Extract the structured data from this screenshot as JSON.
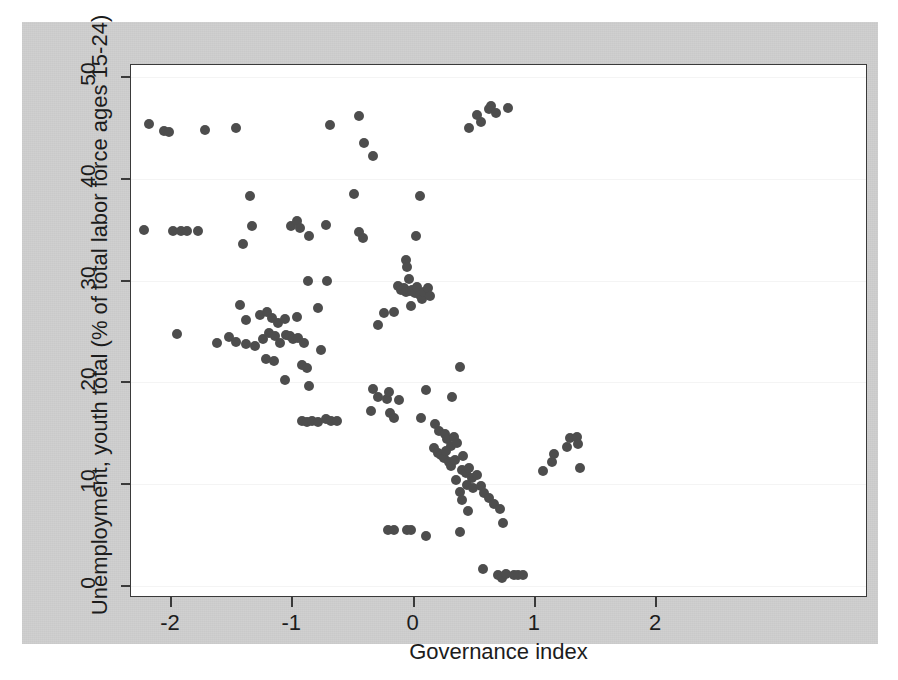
{
  "figure": {
    "background_color": "#cfcfcf",
    "panel_color": "#ffffff",
    "marker_color": "#4d4d4d",
    "axis_color": "#3a3a3a"
  },
  "chart_data": {
    "type": "scatter",
    "title": "",
    "xlabel": "Governance index",
    "ylabel": "Unemployment, youth total (% of total labor force ages 15-24)",
    "xlim": [
      -2.32,
      2.08
    ],
    "ylim": [
      -1.2,
      51.5
    ],
    "xticks": [
      -2,
      -1,
      0,
      1,
      2
    ],
    "xtick_labels": [
      "-2",
      "-1",
      "0",
      "1",
      "2"
    ],
    "yticks": [
      0,
      10,
      20,
      30,
      40,
      50
    ],
    "ytick_labels": [
      "0",
      "10",
      "20",
      "30",
      "40",
      "50"
    ],
    "grid": "horizontal-faint",
    "legend": "none",
    "series_name": "countries",
    "marker": "filled-circle",
    "points": [
      [
        -2.18,
        45.4
      ],
      [
        -2.06,
        44.7
      ],
      [
        -2.02,
        44.6
      ],
      [
        -1.72,
        44.8
      ],
      [
        -1.46,
        45.0
      ],
      [
        -0.69,
        45.3
      ],
      [
        -0.45,
        46.2
      ],
      [
        -0.41,
        43.5
      ],
      [
        -0.33,
        42.2
      ],
      [
        0.46,
        45.0
      ],
      [
        0.52,
        46.3
      ],
      [
        0.56,
        45.6
      ],
      [
        0.62,
        46.9
      ],
      [
        0.64,
        47.2
      ],
      [
        0.68,
        46.5
      ],
      [
        0.78,
        47.0
      ],
      [
        -1.35,
        38.3
      ],
      [
        -0.49,
        38.5
      ],
      [
        0.05,
        38.3
      ],
      [
        -2.22,
        35.0
      ],
      [
        -1.98,
        34.9
      ],
      [
        -1.92,
        34.9
      ],
      [
        -1.87,
        34.9
      ],
      [
        -1.78,
        34.9
      ],
      [
        -1.41,
        33.6
      ],
      [
        -1.33,
        35.4
      ],
      [
        -1.01,
        35.4
      ],
      [
        -0.96,
        35.9
      ],
      [
        -0.94,
        35.2
      ],
      [
        -0.86,
        34.4
      ],
      [
        -0.72,
        35.5
      ],
      [
        -0.45,
        34.8
      ],
      [
        -0.42,
        34.2
      ],
      [
        0.02,
        34.4
      ],
      [
        -0.06,
        32.0
      ],
      [
        -0.05,
        31.3
      ],
      [
        -0.87,
        30.0
      ],
      [
        -0.71,
        30.0
      ],
      [
        -0.04,
        30.2
      ],
      [
        -0.13,
        29.5
      ],
      [
        -0.1,
        29.1
      ],
      [
        -0.08,
        29.3
      ],
      [
        -0.06,
        28.9
      ],
      [
        -0.03,
        29.0
      ],
      [
        -0.01,
        29.1
      ],
      [
        0.01,
        28.8
      ],
      [
        0.03,
        29.4
      ],
      [
        0.05,
        28.6
      ],
      [
        0.07,
        28.2
      ],
      [
        0.09,
        28.9
      ],
      [
        0.12,
        29.3
      ],
      [
        0.14,
        28.5
      ],
      [
        -0.02,
        27.5
      ],
      [
        -0.16,
        26.9
      ],
      [
        -1.43,
        27.6
      ],
      [
        -1.38,
        26.1
      ],
      [
        -1.27,
        26.6
      ],
      [
        -1.21,
        26.9
      ],
      [
        -1.17,
        26.3
      ],
      [
        -1.12,
        25.8
      ],
      [
        -1.06,
        26.2
      ],
      [
        -0.96,
        26.4
      ],
      [
        -0.79,
        27.3
      ],
      [
        -0.24,
        26.8
      ],
      [
        -0.29,
        25.6
      ],
      [
        -1.95,
        24.8
      ],
      [
        -1.62,
        23.9
      ],
      [
        -1.52,
        24.5
      ],
      [
        -1.46,
        24.0
      ],
      [
        -1.38,
        23.8
      ],
      [
        -1.31,
        23.6
      ],
      [
        -1.24,
        24.3
      ],
      [
        -1.19,
        24.9
      ],
      [
        -1.14,
        24.6
      ],
      [
        -1.1,
        23.9
      ],
      [
        -1.05,
        24.7
      ],
      [
        -1.02,
        24.6
      ],
      [
        -0.99,
        24.3
      ],
      [
        -0.95,
        24.4
      ],
      [
        -0.9,
        23.9
      ],
      [
        -0.76,
        23.2
      ],
      [
        -1.22,
        22.3
      ],
      [
        -1.15,
        22.1
      ],
      [
        -0.92,
        21.7
      ],
      [
        -0.88,
        21.4
      ],
      [
        0.38,
        21.5
      ],
      [
        -1.06,
        20.2
      ],
      [
        -0.86,
        19.6
      ],
      [
        -0.33,
        19.4
      ],
      [
        -0.29,
        18.6
      ],
      [
        -0.22,
        18.4
      ],
      [
        0.1,
        19.3
      ],
      [
        0.32,
        18.6
      ],
      [
        -0.2,
        19.1
      ],
      [
        -0.12,
        18.3
      ],
      [
        -0.92,
        16.2
      ],
      [
        -0.88,
        16.1
      ],
      [
        -0.84,
        16.2
      ],
      [
        -0.79,
        16.1
      ],
      [
        -0.72,
        16.4
      ],
      [
        -0.68,
        16.2
      ],
      [
        -0.63,
        16.2
      ],
      [
        -0.35,
        17.2
      ],
      [
        -0.19,
        17.0
      ],
      [
        -0.16,
        16.5
      ],
      [
        0.06,
        16.5
      ],
      [
        0.18,
        15.9
      ],
      [
        0.21,
        15.2
      ],
      [
        0.26,
        14.9
      ],
      [
        0.28,
        14.4
      ],
      [
        0.31,
        13.8
      ],
      [
        0.33,
        14.6
      ],
      [
        0.36,
        14.0
      ],
      [
        0.17,
        13.6
      ],
      [
        0.2,
        13.1
      ],
      [
        0.23,
        12.9
      ],
      [
        0.25,
        12.6
      ],
      [
        0.27,
        13.3
      ],
      [
        0.29,
        12.2
      ],
      [
        0.31,
        11.8
      ],
      [
        0.34,
        12.4
      ],
      [
        0.41,
        12.8
      ],
      [
        0.4,
        11.4
      ],
      [
        0.43,
        11.1
      ],
      [
        0.46,
        11.6
      ],
      [
        0.48,
        10.6
      ],
      [
        0.52,
        10.9
      ],
      [
        0.44,
        9.9
      ],
      [
        0.49,
        9.6
      ],
      [
        0.56,
        9.8
      ],
      [
        0.58,
        9.1
      ],
      [
        0.62,
        8.6
      ],
      [
        0.66,
        8.1
      ],
      [
        0.71,
        7.6
      ],
      [
        0.35,
        10.4
      ],
      [
        0.38,
        9.2
      ],
      [
        0.4,
        8.4
      ],
      [
        0.45,
        7.4
      ],
      [
        0.74,
        6.2
      ],
      [
        1.07,
        11.3
      ],
      [
        1.14,
        12.2
      ],
      [
        1.16,
        13.0
      ],
      [
        1.27,
        13.7
      ],
      [
        1.29,
        14.5
      ],
      [
        1.35,
        14.6
      ],
      [
        1.36,
        13.9
      ],
      [
        1.37,
        11.6
      ],
      [
        -0.21,
        5.5
      ],
      [
        -0.16,
        5.5
      ],
      [
        -0.05,
        5.5
      ],
      [
        -0.02,
        5.5
      ],
      [
        0.1,
        4.9
      ],
      [
        0.38,
        5.3
      ],
      [
        0.57,
        1.7
      ],
      [
        0.7,
        1.1
      ],
      [
        0.73,
        0.8
      ],
      [
        0.76,
        1.2
      ],
      [
        0.83,
        1.1
      ],
      [
        0.86,
        1.1
      ],
      [
        0.9,
        1.1
      ]
    ]
  }
}
